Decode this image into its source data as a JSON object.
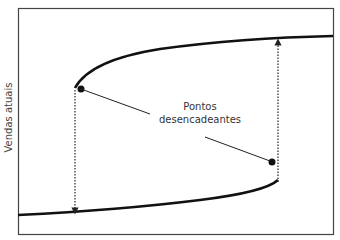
{
  "diagram": {
    "y_axis_label": "Vendas atuais",
    "annotation_line1": "Pontos",
    "annotation_line2": "desencadeantes",
    "curves": {
      "upper_branch": "high-sales stable branch starting at upper trigger point and rising gently to the right",
      "lower_branch": "low-sales stable branch rising from left and curving up to lower trigger point"
    },
    "trigger_points": [
      {
        "name": "upper-left trigger point",
        "x": 81,
        "y": 89
      },
      {
        "name": "lower-right trigger point",
        "x": 272,
        "y": 162
      }
    ],
    "jumps": [
      {
        "from": "upper-left trigger point",
        "direction": "down",
        "to": "lower branch"
      },
      {
        "from": "lower-right trigger point",
        "direction": "up",
        "to": "upper branch"
      }
    ],
    "colors": {
      "line": "#111111",
      "frame": "#333333",
      "text": "#333333"
    }
  }
}
